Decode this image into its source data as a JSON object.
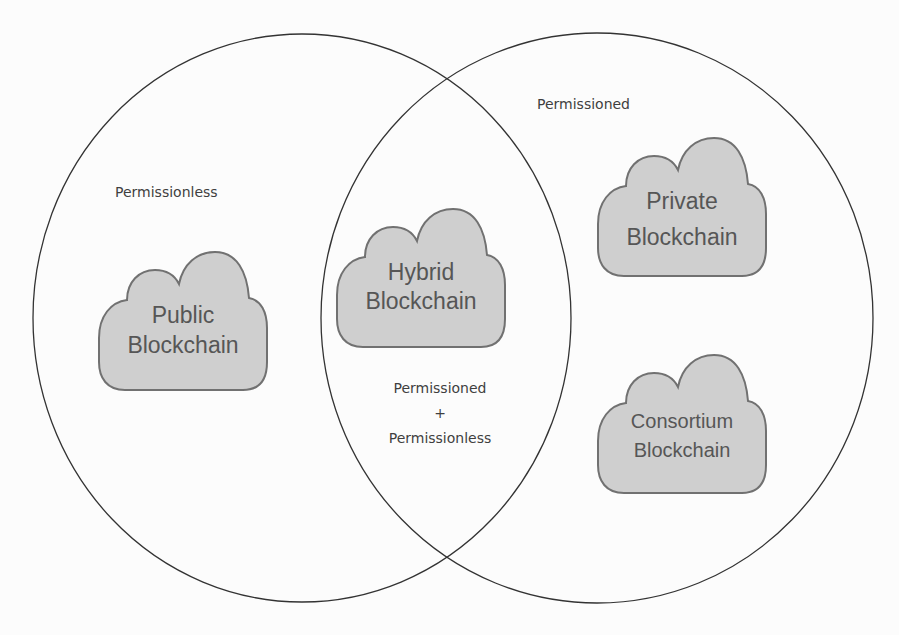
{
  "colors": {
    "background": "#fcfcfc",
    "circle_stroke": "#333333",
    "cloud_fill": "#cfcfcf",
    "cloud_stroke": "#717171",
    "cloud_text": "#565656",
    "label_text": "#3f3f3f"
  },
  "sets": [
    {
      "id": "left",
      "label": "Permissionless"
    },
    {
      "id": "right",
      "label": "Permissioned"
    }
  ],
  "intersection": {
    "line1": "Permissioned",
    "line2": "+",
    "line3": "Permissionless"
  },
  "clouds": [
    {
      "id": "public",
      "line1": "Public",
      "line2": "Blockchain",
      "region": "Permissionless"
    },
    {
      "id": "hybrid",
      "line1": "Hybrid",
      "line2": "Blockchain",
      "region": "Permissioned + Permissionless"
    },
    {
      "id": "private",
      "line1": "Private",
      "line2": "Blockchain",
      "region": "Permissioned"
    },
    {
      "id": "consortium",
      "line1": "Consortium",
      "line2": "Blockchain",
      "region": "Permissioned"
    }
  ]
}
